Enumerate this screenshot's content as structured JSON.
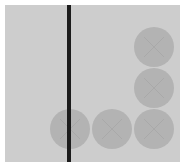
{
  "scene": {
    "board": {
      "x": 5,
      "y": 5,
      "width": 175,
      "height": 157,
      "color": "#cdcdcd"
    },
    "divider": {
      "x": 67,
      "y": 5,
      "width": 4,
      "height": 157,
      "color": "#1c1c1c"
    },
    "piece_color": "#b3b3b3",
    "piece_radius": 20,
    "pieces": [
      {
        "cx": 154,
        "cy": 47,
        "mark": "x-mark-icon"
      },
      {
        "cx": 154,
        "cy": 88,
        "mark": "x-mark-icon"
      },
      {
        "cx": 70,
        "cy": 129,
        "mark": "x-mark-icon"
      },
      {
        "cx": 112,
        "cy": 129,
        "mark": "x-mark-icon"
      },
      {
        "cx": 154,
        "cy": 129,
        "mark": "x-mark-icon"
      }
    ]
  }
}
